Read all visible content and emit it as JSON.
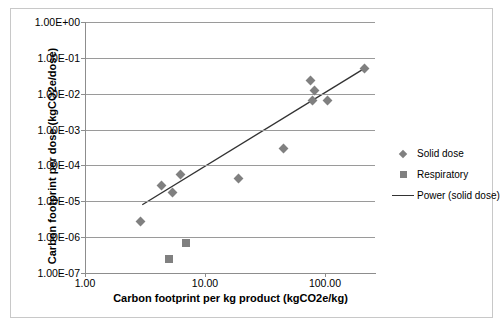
{
  "chart_data": {
    "type": "scatter",
    "title": "",
    "xlabel": "Carbon footprint per kg product (kgCO2e/kg)",
    "ylabel": "Carbon footprint per dose (kgCO2e/dose)",
    "xscale": "log",
    "yscale": "log",
    "xlim": [
      1.0,
      250.0
    ],
    "ylim": [
      1e-07,
      1.0
    ],
    "grid": "horizontal",
    "legend_position": "right",
    "xticks": [
      1.0,
      10.0,
      100.0
    ],
    "xticklabels": [
      "1.00",
      "10.00",
      "100.00"
    ],
    "yticks": [
      1.0,
      0.1,
      0.01,
      0.001,
      0.0001,
      1e-05,
      1e-06,
      1e-07
    ],
    "yticklabels": [
      "1.00E+00",
      "1.00E-01",
      "1.00E-02",
      "1.00E-03",
      "1.00E-04",
      "1.00E-05",
      "1.00E-06",
      "1.00E-07"
    ],
    "series": [
      {
        "name": "Solid dose",
        "marker": "diamond",
        "color": "#808080",
        "points": [
          {
            "x": 2.9,
            "y": 2.8e-06
          },
          {
            "x": 4.3,
            "y": 2.7e-05
          },
          {
            "x": 5.4,
            "y": 1.8e-05
          },
          {
            "x": 6.2,
            "y": 5.5e-05
          },
          {
            "x": 19.0,
            "y": 4.3e-05
          },
          {
            "x": 45.0,
            "y": 0.0003
          },
          {
            "x": 75.0,
            "y": 0.023
          },
          {
            "x": 82.0,
            "y": 0.012
          },
          {
            "x": 78.0,
            "y": 0.0065
          },
          {
            "x": 105.0,
            "y": 0.0063
          },
          {
            "x": 215.0,
            "y": 0.05
          }
        ]
      },
      {
        "name": "Respiratory",
        "marker": "square",
        "color": "#808080",
        "points": [
          {
            "x": 5.0,
            "y": 2.4e-07
          },
          {
            "x": 7.0,
            "y": 6.8e-07
          }
        ]
      },
      {
        "name": "Power (solid dose)",
        "marker": "line",
        "color": "#333333",
        "line": {
          "x_start": 3.0,
          "y_start": 8e-06,
          "x_end": 215.0,
          "y_end": 0.052
        }
      }
    ],
    "legend": [
      {
        "label": "Solid dose",
        "marker": "diamond"
      },
      {
        "label": "Respiratory",
        "marker": "square"
      },
      {
        "label": "Power (solid dose)",
        "marker": "line"
      }
    ]
  }
}
